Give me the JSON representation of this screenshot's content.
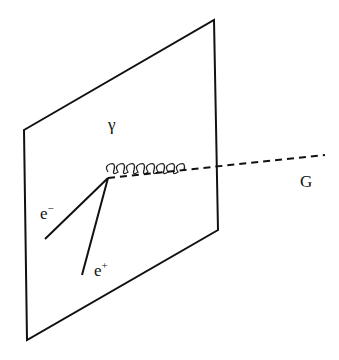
{
  "diagram": {
    "type": "particle-interaction",
    "plane": {
      "corners": [
        [
          24,
          130
        ],
        [
          214,
          20
        ],
        [
          218,
          230
        ],
        [
          27,
          340
        ]
      ]
    },
    "vertex": [
      108,
      178
    ],
    "particles": [
      {
        "id": "photon",
        "label": "γ",
        "line": "wavy",
        "from": [
          108,
          178
        ],
        "to": [
          152,
          96
        ]
      },
      {
        "id": "electron",
        "label": "e",
        "sup": "−",
        "line": "solid",
        "from": [
          108,
          178
        ],
        "to": [
          45,
          239
        ]
      },
      {
        "id": "positron",
        "label": "e",
        "sup": "+",
        "line": "solid",
        "from": [
          108,
          178
        ],
        "to": [
          82,
          275
        ]
      },
      {
        "id": "graviton",
        "label": "G",
        "line": "dashed",
        "from": [
          108,
          178
        ],
        "to": [
          325,
          155
        ]
      }
    ]
  },
  "labels": {
    "photon": "γ",
    "electron_base": "e",
    "electron_sup": "−",
    "positron_base": "e",
    "positron_sup": "+",
    "graviton": "G"
  }
}
